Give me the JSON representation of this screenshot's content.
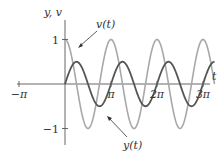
{
  "chart_data": {
    "type": "line",
    "title": "",
    "xlabel": "t",
    "ylabel": "y, v",
    "xlim_pi": [
      -1.0,
      3.25
    ],
    "ylim": [
      -1.25,
      1.25
    ],
    "grid": false,
    "x_ticks": [
      {
        "value_pi": -1,
        "label": "−π"
      },
      {
        "value_pi": 1,
        "label": "π"
      },
      {
        "value_pi": 2,
        "label": "2π"
      },
      {
        "value_pi": 3,
        "label": "3π"
      }
    ],
    "y_ticks": [
      {
        "value": 1,
        "label": "1"
      },
      {
        "value": -1,
        "label": "−1"
      }
    ],
    "series": [
      {
        "name": "v(t)",
        "formula": "cos(2t)",
        "amplitude": 1,
        "angular_frequency": 2,
        "phase": "cos",
        "t_start": 0,
        "t_end_pi": 3.25,
        "color": "#a8a8a8"
      },
      {
        "name": "y(t)",
        "formula": "0.5 sin(2t)",
        "amplitude": 0.5,
        "angular_frequency": 2,
        "phase": "sin",
        "t_start": 0,
        "t_end_pi": 3.25,
        "color": "#555555"
      }
    ],
    "annotations": [
      {
        "label": "v(t)",
        "points_to": "v(t)"
      },
      {
        "label": "y(t)",
        "points_to": "y(t)"
      }
    ]
  }
}
